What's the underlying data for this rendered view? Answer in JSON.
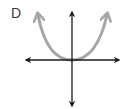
{
  "figure": {
    "option_label": "D",
    "curve": {
      "shape": "quartic-like U",
      "vertex": [
        0,
        0
      ],
      "end_behavior": "both ends up",
      "color": "#a6a6a6"
    },
    "axes": {
      "color": "#1a1a1a",
      "x_axis_arrows": "both",
      "y_axis_arrows": "both"
    }
  }
}
